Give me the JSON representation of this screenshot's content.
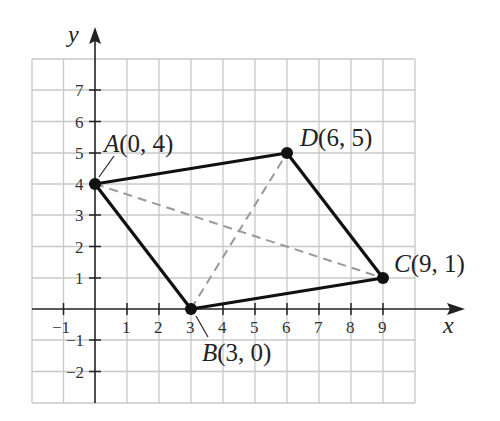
{
  "diagram": {
    "axes": {
      "x_label": "x",
      "y_label": "y",
      "x_ticks": [
        "−1",
        "1",
        "2",
        "3",
        "4",
        "5",
        "6",
        "7",
        "8",
        "9"
      ],
      "y_ticks": [
        "7",
        "6",
        "5",
        "4",
        "3",
        "2",
        "1",
        "−1",
        "−2"
      ]
    },
    "points": [
      {
        "name": "A",
        "label": "A(0, 4)",
        "x": 0,
        "y": 4
      },
      {
        "name": "B",
        "label": "B(3, 0)",
        "x": 3,
        "y": 0
      },
      {
        "name": "C",
        "label": "C(9, 1)",
        "x": 9,
        "y": 1
      },
      {
        "name": "D",
        "label": "D(6, 5)",
        "x": 6,
        "y": 5
      }
    ],
    "labels": {
      "A": "A(0, 4)",
      "B": "B(3, 0)",
      "C": "C(9, 1)",
      "D": "D(6, 5)"
    },
    "grid": {
      "x_min": -2,
      "x_max": 10,
      "y_min": -3,
      "y_max": 8
    },
    "colors": {
      "grid": "#c8c8c8",
      "axis": "#222222",
      "shape": "#111111",
      "diagonal": "#999999"
    }
  }
}
